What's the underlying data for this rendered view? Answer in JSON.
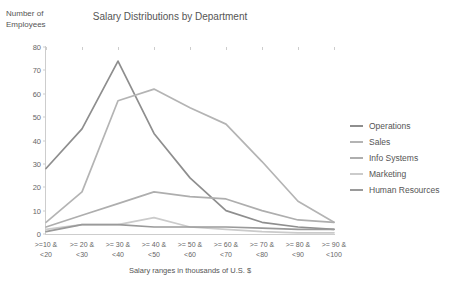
{
  "chart_data": {
    "type": "line",
    "title": "Salary Distributions by Department",
    "xlabel": "Salary ranges in thousands of U.S. $",
    "ylabel": "Number of\nEmployees",
    "ylim": [
      0,
      80
    ],
    "yticks": [
      0,
      10,
      20,
      30,
      40,
      50,
      60,
      70,
      80
    ],
    "grid": false,
    "legend_position": "right",
    "categories": [
      ">=10 &\n<20",
      ">= 20 &\n<30",
      ">= 30 &\n<40",
      ">= 40 &\n<50",
      ">= 50 &\n<60",
      ">= 60 &\n<70",
      ">= 70 &\n<80",
      ">= 80 &\n<90",
      ">= 90 &\n<100"
    ],
    "series": [
      {
        "name": "Operations",
        "color": "#8e8e8e",
        "values": [
          28,
          45,
          74,
          43,
          24,
          10,
          5,
          3,
          2
        ]
      },
      {
        "name": "Sales",
        "color": "#b4b4b4",
        "values": [
          5,
          18,
          57,
          62,
          54,
          47,
          31,
          14,
          5
        ]
      },
      {
        "name": "Info Systems",
        "color": "#aeaeae",
        "values": [
          3,
          8,
          13,
          18,
          16,
          15,
          10,
          6,
          5
        ]
      },
      {
        "name": "Marketing",
        "color": "#cbcbcb",
        "values": [
          2,
          4,
          4,
          7,
          3,
          2,
          1,
          0.5,
          0.5
        ]
      },
      {
        "name": "Human Resources",
        "color": "#9a9a9a",
        "values": [
          1,
          4,
          4,
          3,
          3,
          3,
          2.5,
          2,
          2
        ]
      }
    ]
  }
}
